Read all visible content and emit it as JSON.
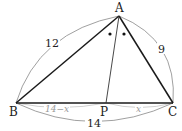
{
  "diagram": {
    "type": "triangle-angle-bisector",
    "points": {
      "A": {
        "label": "A",
        "x": 119,
        "y": 16
      },
      "B": {
        "label": "B",
        "x": 16,
        "y": 103
      },
      "C": {
        "label": "C",
        "x": 173,
        "y": 103
      },
      "P": {
        "label": "P",
        "x": 106,
        "y": 103
      }
    },
    "lengths": {
      "AB": "12",
      "AC": "9",
      "BC": "14",
      "BP": "14−x",
      "PC": "x"
    },
    "angle_marks": {
      "symbol": "•",
      "count": 2,
      "meaning": "∠BAP = ∠PAC"
    },
    "colors": {
      "triangle": "#1a1a1a",
      "bisector": "#333333",
      "arc": "#777777",
      "segment_label": "#9a9a9a"
    }
  }
}
